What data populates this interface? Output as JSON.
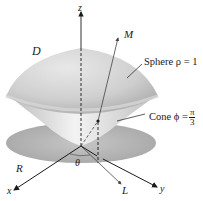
{
  "figure": {
    "labels": {
      "z_axis": "z",
      "x_axis": "x",
      "y_axis": "y",
      "region_d": "D",
      "region_r": "R",
      "ray_m": "M",
      "ray_l": "L",
      "angle_theta": "θ",
      "sphere": "Sphere ρ = 1",
      "cone_prefix": "Cone ϕ =",
      "cone_num": "π",
      "cone_den": "3"
    },
    "colors": {
      "surface_light": "#e6e6e6",
      "surface_mid": "#c8c8c8",
      "surface_dark": "#a9a9a9",
      "disk": "#b5b5b5",
      "line": "#1a1a1a"
    }
  }
}
